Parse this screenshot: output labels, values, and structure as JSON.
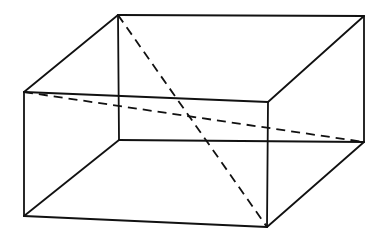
{
  "diagram": {
    "type": "cuboid-wireframe",
    "colors": {
      "line": "#111111",
      "background": "#ffffff"
    },
    "vertices": {
      "back_top_left": [
        118,
        15
      ],
      "back_top_right": [
        364,
        16
      ],
      "back_bottom_left": [
        119,
        140
      ],
      "back_bottom_right": [
        364,
        142
      ],
      "front_top_left": [
        24,
        92
      ],
      "front_top_right": [
        268,
        102
      ],
      "front_bottom_left": [
        24,
        216
      ],
      "front_bottom_right": [
        267,
        227
      ]
    },
    "edges": [
      [
        "back_top_left",
        "back_top_right"
      ],
      [
        "back_top_left",
        "front_top_left"
      ],
      [
        "back_top_right",
        "front_top_right"
      ],
      [
        "front_top_left",
        "front_top_right"
      ],
      [
        "back_top_right",
        "back_bottom_right"
      ],
      [
        "back_top_left",
        "back_bottom_left"
      ],
      [
        "front_top_left",
        "front_bottom_left"
      ],
      [
        "front_top_right",
        "front_bottom_right"
      ],
      [
        "back_bottom_left",
        "back_bottom_right"
      ],
      [
        "back_bottom_left",
        "front_bottom_left"
      ],
      [
        "back_bottom_right",
        "front_bottom_right"
      ],
      [
        "front_bottom_left",
        "front_bottom_right"
      ]
    ],
    "dashed_diagonals": [
      [
        "back_top_left",
        "front_bottom_right"
      ],
      [
        "front_top_left",
        "back_bottom_right"
      ]
    ]
  }
}
